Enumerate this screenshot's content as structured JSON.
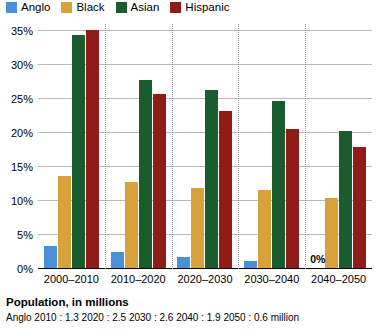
{
  "legend": {
    "items": [
      {
        "label": "Anglo",
        "color": "#4a90d9"
      },
      {
        "label": "Black",
        "color": "#d9a13a"
      },
      {
        "label": "Asian",
        "color": "#1a5c2e"
      },
      {
        "label": "Hispanic",
        "color": "#8f1c17"
      }
    ]
  },
  "chart_data": {
    "type": "bar",
    "title": "",
    "xlabel": "",
    "ylabel": "",
    "categories": [
      "2000–2010",
      "2010–2020",
      "2020–2030",
      "2030–2040",
      "2040–2050"
    ],
    "series": [
      {
        "name": "Anglo",
        "color": "#4a90d9",
        "values": [
          3.2,
          2.4,
          1.6,
          1.0,
          0.0
        ]
      },
      {
        "name": "Black",
        "color": "#d9a13a",
        "values": [
          13.5,
          12.6,
          11.8,
          11.5,
          10.3
        ]
      },
      {
        "name": "Asian",
        "color": "#1a5c2e",
        "values": [
          34.2,
          27.6,
          26.2,
          24.6,
          20.1
        ]
      },
      {
        "name": "Hispanic",
        "color": "#8f1c17",
        "values": [
          35.0,
          25.6,
          23.0,
          20.5,
          17.8
        ]
      }
    ],
    "ylim": [
      0,
      36
    ],
    "yticks": [
      0,
      5,
      10,
      15,
      20,
      25,
      30,
      35
    ],
    "ytick_labels": [
      "0%",
      "5%",
      "10%",
      "15%",
      "20%",
      "25%",
      "30%",
      "35%"
    ],
    "grid": true,
    "legend_position": "top-left",
    "annotations": [
      {
        "text": "0%",
        "group": "2040–2050",
        "series": "Anglo"
      }
    ]
  },
  "footer": {
    "title": "Population, in millions",
    "note": "Anglo       2010 : 1.3     2020 : 2.5     2030 : 2.6     2040 : 1.9     2050 : 0.6  million"
  }
}
